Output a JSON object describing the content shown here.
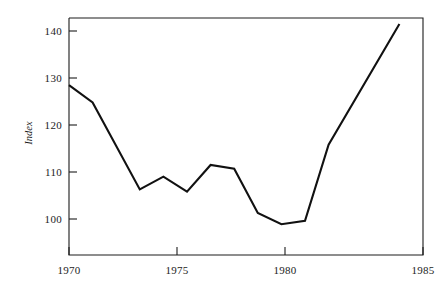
{
  "chart_data": {
    "type": "line",
    "title": "",
    "subtitle": "",
    "xlabel": "",
    "ylabel": "Index",
    "xlim": [
      1970,
      1985
    ],
    "ylim": [
      95.5,
      142.5
    ],
    "grid": false,
    "legend": null,
    "xticks": [
      1970,
      1975,
      1980,
      1985
    ],
    "xtick_labels": [
      "1970",
      "1975",
      "1980",
      "1985"
    ],
    "yticks": [
      100,
      110,
      120,
      130,
      140
    ],
    "ytick_labels": [
      "100",
      "110",
      "120",
      "130",
      "140"
    ],
    "series": [
      {
        "name": "Index",
        "color": "#111111",
        "x": [
          1970,
          1971,
          1973,
          1974,
          1975,
          1976,
          1977,
          1978,
          1979,
          1980,
          1981,
          1984
        ],
        "values": [
          128.5,
          124.8,
          106.3,
          109.0,
          105.8,
          111.5,
          110.7,
          101.3,
          98.9,
          99.6,
          115.8,
          141.5
        ]
      }
    ],
    "annotations": []
  },
  "axis": {
    "ylabel": "Index",
    "ytick_labels": [
      "140",
      "130",
      "120",
      "110",
      "100"
    ],
    "xtick_labels": [
      "1970",
      "1975",
      "1980",
      "1985"
    ]
  }
}
